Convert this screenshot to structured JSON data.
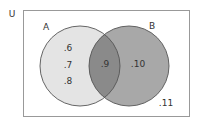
{
  "diagram": {
    "type": "venn",
    "universe": {
      "label": "U",
      "element_outside": ".11"
    },
    "sets": [
      {
        "name": "A",
        "label": "A",
        "only_elements": [
          ".6",
          ".7",
          ".8"
        ]
      },
      {
        "name": "B",
        "label": "B",
        "only_elements": [
          ".10"
        ]
      }
    ],
    "intersection": {
      "sets": [
        "A",
        "B"
      ],
      "elements": [
        ".9"
      ]
    },
    "colors": {
      "background": "#ffffff",
      "universe_border": "#999999",
      "set_a_fill": "#e4e4e4",
      "set_b_fill": "#a8a8a8",
      "intersection_fill": "#8a8a8a",
      "circle_stroke": "#555555",
      "text": "#333333"
    }
  }
}
